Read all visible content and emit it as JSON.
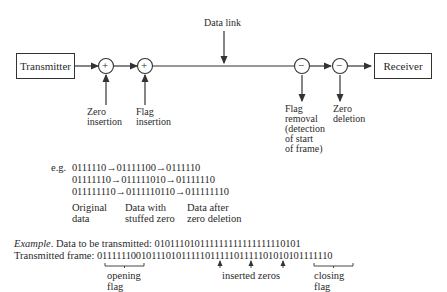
{
  "diagram": {
    "title_cut": "",
    "data_link_label": "Data link",
    "transmitter_label": "Transmitter",
    "receiver_label": "Receiver",
    "nodes": [
      {
        "symbol": "+",
        "label_lines": [
          "Zero",
          "insertion"
        ]
      },
      {
        "symbol": "+",
        "label_lines": [
          "Flag",
          "insertion"
        ]
      },
      {
        "symbol": "−",
        "label_lines": [
          "Flag",
          "removal",
          "(detection",
          "of start",
          "of frame)"
        ]
      },
      {
        "symbol": "−",
        "label_lines": [
          "Zero",
          "deletion"
        ]
      }
    ]
  },
  "examples": {
    "prefix": "e.g.",
    "rows": [
      "0111110→01111100→0111110",
      "01111110→011111010→01111110",
      "011111110→0111110110→011111110"
    ],
    "column_labels": [
      {
        "line1": "Original",
        "line2": "data"
      },
      {
        "line1": "Data with",
        "line2": "stuffed zero"
      },
      {
        "line1": "Data after",
        "line2": "zero deletion"
      }
    ]
  },
  "example_block": {
    "example_word": "Example",
    "data_line_label": ". Data to be transmitted: ",
    "data_bits": "010111010111111111111111110101",
    "frame_label": "Transmitted frame: ",
    "frame_bits": "011111100101110101111101111101111101010101111110",
    "opening_flag_label": [
      "opening",
      "flag"
    ],
    "inserted_zeros_label": "inserted zeros",
    "closing_flag_label": [
      "closing",
      "flag"
    ]
  }
}
